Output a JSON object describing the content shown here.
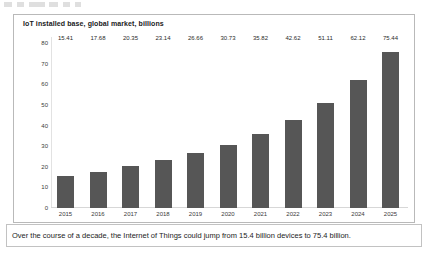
{
  "chart_data": {
    "type": "bar",
    "title": "IoT installed base, global market, billions",
    "xlabel": "",
    "ylabel": "",
    "ylim": [
      0,
      80
    ],
    "yticks": [
      80,
      70,
      60,
      50,
      40,
      30,
      20,
      10,
      0
    ],
    "grid": false,
    "legend": false,
    "bar_color": "#565656",
    "categories": [
      "2015",
      "2016",
      "2017",
      "2018",
      "2019",
      "2020",
      "2021",
      "2022",
      "2023",
      "2024",
      "2025"
    ],
    "values": [
      15.41,
      17.68,
      20.35,
      23.14,
      26.66,
      30.73,
      35.82,
      42.62,
      51.11,
      62.12,
      75.44
    ],
    "value_labels": [
      "15.41",
      "17.68",
      "20.35",
      "23.14",
      "26.66",
      "30.73",
      "35.82",
      "42.62",
      "51.11",
      "62.12",
      "75.44"
    ]
  },
  "caption": {
    "text": "Over the course of a decade, the Internet of Things could jump from 15.4 billion devices to 75.4 billion."
  }
}
